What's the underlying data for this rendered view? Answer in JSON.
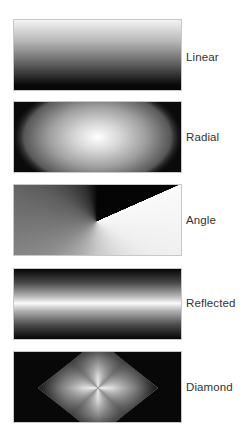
{
  "gradients": [
    {
      "id": "linear",
      "label": "Linear"
    },
    {
      "id": "radial",
      "label": "Radial"
    },
    {
      "id": "angle",
      "label": "Angle"
    },
    {
      "id": "reflected",
      "label": "Reflected"
    },
    {
      "id": "diamond",
      "label": "Diamond"
    }
  ],
  "colors": {
    "dark": "#050505",
    "light": "#ffffff",
    "label_text": "#333333",
    "swatch_border": "#c8c8c8"
  }
}
